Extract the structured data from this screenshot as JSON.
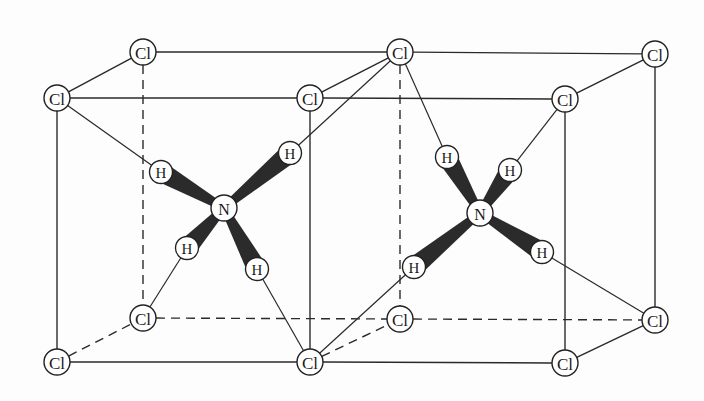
{
  "diagram": {
    "type": "crystal-structure",
    "labels": {
      "chlorine": "Cl",
      "nitrogen": "N",
      "hydrogen": "H"
    },
    "colors": {
      "line": "#2a2a2a",
      "wedge": "#2b2b2b",
      "atom_fill": "#ffffff",
      "background": "#fdfdfd"
    }
  },
  "chlorine_atoms": [
    {
      "id": "cl_back_top_left",
      "label": "Cl",
      "x": 143,
      "y": 52
    },
    {
      "id": "cl_back_top_mid",
      "label": "Cl",
      "x": 400,
      "y": 52
    },
    {
      "id": "cl_back_top_right",
      "label": "Cl",
      "x": 655,
      "y": 54
    },
    {
      "id": "cl_front_top_left",
      "label": "Cl",
      "x": 57,
      "y": 98
    },
    {
      "id": "cl_front_top_mid",
      "label": "Cl",
      "x": 310,
      "y": 98
    },
    {
      "id": "cl_front_top_right",
      "label": "Cl",
      "x": 565,
      "y": 99
    },
    {
      "id": "cl_back_bottom_left",
      "label": "Cl",
      "x": 143,
      "y": 318
    },
    {
      "id": "cl_back_bottom_mid",
      "label": "Cl",
      "x": 400,
      "y": 319
    },
    {
      "id": "cl_back_bottom_right",
      "label": "Cl",
      "x": 655,
      "y": 320
    },
    {
      "id": "cl_front_bottom_left",
      "label": "Cl",
      "x": 57,
      "y": 362
    },
    {
      "id": "cl_front_bottom_mid",
      "label": "Cl",
      "x": 310,
      "y": 362
    },
    {
      "id": "cl_front_bottom_right",
      "label": "Cl",
      "x": 565,
      "y": 363
    }
  ],
  "ammonium_ions": [
    {
      "id": "nh4_left",
      "nitrogen": {
        "label": "N",
        "x": 224,
        "y": 208
      },
      "hydrogens": [
        {
          "label": "H",
          "x": 161,
          "y": 172,
          "bonded_cl": "cl_front_top_left"
        },
        {
          "label": "H",
          "x": 290,
          "y": 153,
          "bonded_cl": "cl_back_top_mid"
        },
        {
          "label": "H",
          "x": 187,
          "y": 248,
          "bonded_cl": "cl_back_bottom_left"
        },
        {
          "label": "H",
          "x": 257,
          "y": 269,
          "bonded_cl": "cl_front_bottom_mid"
        }
      ]
    },
    {
      "id": "nh4_right",
      "nitrogen": {
        "label": "N",
        "x": 480,
        "y": 213
      },
      "hydrogens": [
        {
          "label": "H",
          "x": 447,
          "y": 157,
          "bonded_cl": "cl_back_top_mid"
        },
        {
          "label": "H",
          "x": 510,
          "y": 170,
          "bonded_cl": "cl_front_top_right"
        },
        {
          "label": "H",
          "x": 414,
          "y": 267,
          "bonded_cl": "cl_front_bottom_mid"
        },
        {
          "label": "H",
          "x": 542,
          "y": 252,
          "bonded_cl": "cl_back_bottom_right"
        }
      ]
    }
  ],
  "cell_edges": {
    "solid": [
      [
        "cl_back_top_left",
        "cl_back_top_mid"
      ],
      [
        "cl_back_top_mid",
        "cl_back_top_right"
      ],
      [
        "cl_front_top_left",
        "cl_front_top_mid"
      ],
      [
        "cl_front_top_mid",
        "cl_front_top_right"
      ],
      [
        "cl_front_top_left",
        "cl_back_top_left"
      ],
      [
        "cl_front_top_mid",
        "cl_back_top_mid"
      ],
      [
        "cl_front_top_right",
        "cl_back_top_right"
      ],
      [
        "cl_front_top_left",
        "cl_front_bottom_left"
      ],
      [
        "cl_front_top_mid",
        "cl_front_bottom_mid"
      ],
      [
        "cl_front_top_right",
        "cl_front_bottom_right"
      ],
      [
        "cl_back_top_right",
        "cl_back_bottom_right"
      ],
      [
        "cl_front_bottom_left",
        "cl_front_bottom_mid"
      ],
      [
        "cl_front_bottom_mid",
        "cl_front_bottom_right"
      ],
      [
        "cl_front_bottom_right",
        "cl_back_bottom_right"
      ]
    ],
    "dashed": [
      [
        "cl_back_top_left",
        "cl_back_bottom_left"
      ],
      [
        "cl_back_top_mid",
        "cl_back_bottom_mid"
      ],
      [
        "cl_back_bottom_left",
        "cl_back_bottom_mid"
      ],
      [
        "cl_back_bottom_mid",
        "cl_back_bottom_right"
      ],
      [
        "cl_front_bottom_left",
        "cl_back_bottom_left"
      ],
      [
        "cl_front_bottom_mid",
        "cl_back_bottom_mid"
      ]
    ]
  }
}
